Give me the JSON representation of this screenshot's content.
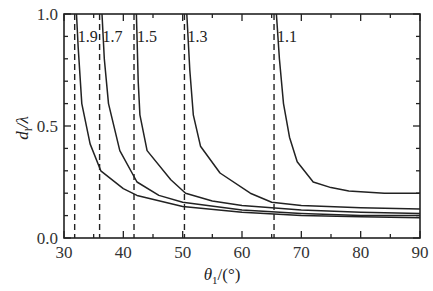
{
  "chart_data": {
    "type": "line",
    "title": "",
    "xlabel": "θ1/(°)",
    "ylabel": "d1/λ",
    "xlim": [
      30,
      90
    ],
    "ylim": [
      0.0,
      1.0
    ],
    "xticks": [
      30,
      40,
      50,
      60,
      70,
      80,
      90
    ],
    "xtick_labels": [
      "30",
      "40",
      "50",
      "60",
      "70",
      "80",
      "90"
    ],
    "yticks": [
      0.0,
      0.5,
      1.0
    ],
    "ytick_labels": [
      "0.0",
      "0.5",
      "1.0"
    ],
    "x_minor_step": 5,
    "y_minor_step": 0.1,
    "grid": false,
    "legend": "none (curves labeled inline)",
    "series": [
      {
        "name": "1.9",
        "label": "1.9",
        "asymptote_x": 31.8,
        "x": [
          32.1,
          32.4,
          33.0,
          34.4,
          36.2,
          40.0,
          42.3,
          50,
          60,
          70,
          80,
          90
        ],
        "y": [
          1.0,
          0.85,
          0.6,
          0.42,
          0.3,
          0.22,
          0.19,
          0.14,
          0.115,
          0.1,
          0.095,
          0.09
        ]
      },
      {
        "name": "1.7",
        "label": "1.7",
        "asymptote_x": 36.0,
        "x": [
          36.4,
          36.8,
          37.5,
          39.4,
          42.3,
          46,
          50,
          60,
          70,
          80,
          90
        ],
        "y": [
          1.0,
          0.8,
          0.6,
          0.39,
          0.25,
          0.19,
          0.16,
          0.125,
          0.11,
          0.1,
          0.1
        ]
      },
      {
        "name": "1.5",
        "label": "1.5",
        "asymptote_x": 41.8,
        "x": [
          42.2,
          42.5,
          42.8,
          44.0,
          48.0,
          50.5,
          55,
          60,
          70,
          80,
          90
        ],
        "y": [
          1.0,
          0.7,
          0.55,
          0.39,
          0.26,
          0.2,
          0.165,
          0.145,
          0.125,
          0.115,
          0.11
        ]
      },
      {
        "name": "1.3",
        "label": "1.3",
        "asymptote_x": 50.3,
        "x": [
          50.7,
          51.2,
          51.8,
          53.0,
          56.3,
          61.4,
          65.0,
          70,
          80,
          90
        ],
        "y": [
          1.0,
          0.75,
          0.55,
          0.41,
          0.29,
          0.2,
          0.16,
          0.145,
          0.135,
          0.13
        ]
      },
      {
        "name": "1.1",
        "label": "1.1",
        "asymptote_x": 65.4,
        "x": [
          65.8,
          66.3,
          67.0,
          68.0,
          69.3,
          72.0,
          75.0,
          78.0,
          84.0,
          90
        ],
        "y": [
          1.0,
          0.8,
          0.6,
          0.45,
          0.34,
          0.25,
          0.225,
          0.21,
          0.2,
          0.2
        ]
      }
    ],
    "dashed_vertical_lines": [
      31.8,
      36.0,
      41.8,
      50.3,
      65.4
    ],
    "annotations": [
      "1.9",
      "1.7",
      "1.5",
      "1.3",
      "1.1"
    ]
  },
  "labels": {
    "x_axis_title_main": "θ",
    "x_axis_title_sub": "1",
    "x_axis_title_unit": "/(°)",
    "y_axis_title_main": "d",
    "y_axis_title_sub": "l",
    "y_axis_title_unit": "/λ"
  }
}
